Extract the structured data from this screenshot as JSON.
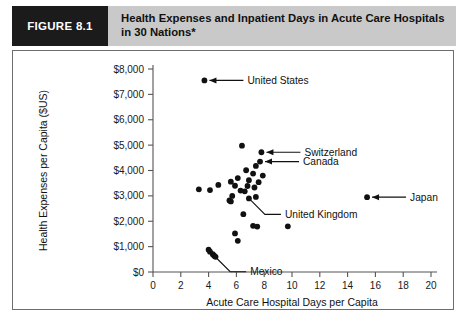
{
  "figure": {
    "tag": "FIGURE 8.1",
    "title": "Health Expenses and Inpatient Days in Acute Care Hospitals in 30 Nations*"
  },
  "chart_data": {
    "type": "scatter",
    "title": "Health Expenses and Inpatient Days in Acute Care Hospitals in 30 Nations*",
    "xlabel": "Acute Care Hospital Days per Capita",
    "ylabel": "Health Expenses per Capita ($US)",
    "xlim": [
      0,
      20
    ],
    "ylim": [
      0,
      8000
    ],
    "xticks": [
      0,
      2,
      4,
      6,
      8,
      10,
      12,
      14,
      16,
      18,
      20
    ],
    "xticklabels": [
      "0",
      "2",
      "4",
      "6",
      "8",
      "10",
      "12",
      "14",
      "16",
      "18",
      "20"
    ],
    "yticks": [
      0,
      1000,
      2000,
      3000,
      4000,
      5000,
      6000,
      7000,
      8000
    ],
    "yticklabels": [
      "$0",
      "$1,000",
      "$2,000",
      "$3,000",
      "$4,000",
      "$5,000",
      "$6,000",
      "$7,000",
      "$8,000"
    ],
    "grid": false,
    "legend": "none",
    "marker_color": "#111111",
    "points": [
      {
        "x": 3.7,
        "y": 7550,
        "label": "United States"
      },
      {
        "x": 6.4,
        "y": 4980,
        "label": ""
      },
      {
        "x": 7.8,
        "y": 4720,
        "label": "Switzerland"
      },
      {
        "x": 7.7,
        "y": 4350,
        "label": "Canada"
      },
      {
        "x": 7.4,
        "y": 4180,
        "label": ""
      },
      {
        "x": 6.7,
        "y": 4010,
        "label": ""
      },
      {
        "x": 7.2,
        "y": 3880,
        "label": ""
      },
      {
        "x": 7.9,
        "y": 3800,
        "label": ""
      },
      {
        "x": 6.1,
        "y": 3700,
        "label": ""
      },
      {
        "x": 5.6,
        "y": 3560,
        "label": ""
      },
      {
        "x": 6.9,
        "y": 3620,
        "label": ""
      },
      {
        "x": 7.6,
        "y": 3540,
        "label": ""
      },
      {
        "x": 4.7,
        "y": 3430,
        "label": ""
      },
      {
        "x": 5.9,
        "y": 3400,
        "label": ""
      },
      {
        "x": 6.8,
        "y": 3390,
        "label": ""
      },
      {
        "x": 7.3,
        "y": 3330,
        "label": ""
      },
      {
        "x": 3.3,
        "y": 3260,
        "label": ""
      },
      {
        "x": 4.1,
        "y": 3230,
        "label": ""
      },
      {
        "x": 6.3,
        "y": 3210,
        "label": ""
      },
      {
        "x": 6.6,
        "y": 3180,
        "label": ""
      },
      {
        "x": 5.7,
        "y": 3000,
        "label": ""
      },
      {
        "x": 7.4,
        "y": 2960,
        "label": ""
      },
      {
        "x": 5.5,
        "y": 2820,
        "label": ""
      },
      {
        "x": 5.6,
        "y": 2780,
        "label": ""
      },
      {
        "x": 6.9,
        "y": 2900,
        "label": "United Kingdom"
      },
      {
        "x": 15.4,
        "y": 2950,
        "label": "Japan"
      },
      {
        "x": 6.5,
        "y": 2280,
        "label": ""
      },
      {
        "x": 7.2,
        "y": 1820,
        "label": ""
      },
      {
        "x": 7.5,
        "y": 1790,
        "label": ""
      },
      {
        "x": 9.7,
        "y": 1800,
        "label": ""
      },
      {
        "x": 5.9,
        "y": 1520,
        "label": ""
      },
      {
        "x": 6.1,
        "y": 1230,
        "label": ""
      },
      {
        "x": 4.0,
        "y": 880,
        "label": ""
      },
      {
        "x": 4.1,
        "y": 800,
        "label": ""
      },
      {
        "x": 4.3,
        "y": 700,
        "label": ""
      },
      {
        "x": 4.4,
        "y": 640,
        "label": "Mexico"
      },
      {
        "x": 4.5,
        "y": 600,
        "label": ""
      }
    ],
    "annotations": [
      {
        "name": "United States",
        "text": "United States",
        "point_x": 3.7,
        "point_y": 7550,
        "style": "arrow-right"
      },
      {
        "name": "Switzerland",
        "text": "Switzerland",
        "point_x": 7.8,
        "point_y": 4720,
        "style": "arrow-right"
      },
      {
        "name": "Canada",
        "text": "Canada",
        "point_x": 7.7,
        "point_y": 4350,
        "style": "arrow-right"
      },
      {
        "name": "Japan",
        "text": "Japan",
        "point_x": 15.4,
        "point_y": 2950,
        "style": "arrow-right"
      },
      {
        "name": "United Kingdom",
        "text": "United Kingdom",
        "point_x": 6.9,
        "point_y": 2900,
        "style": "leader"
      },
      {
        "name": "Mexico",
        "text": "Mexico",
        "point_x": 4.4,
        "point_y": 640,
        "style": "leader"
      }
    ]
  }
}
